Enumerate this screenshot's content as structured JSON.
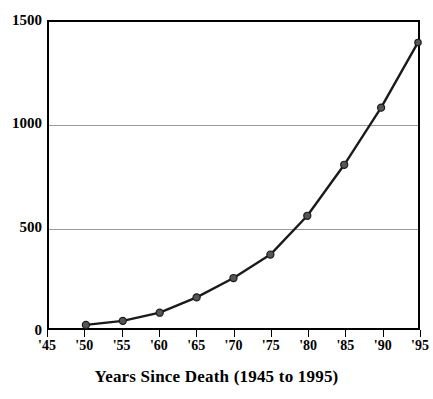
{
  "chart_data": {
    "type": "line",
    "title": "",
    "xlabel": "Years Since Death (1945 to 1995)",
    "ylabel": "",
    "xlim": [
      1945,
      1995
    ],
    "ylim": [
      0,
      1500
    ],
    "grid": "horizontal-only",
    "legend": "none",
    "marker": "filled-circle",
    "line_color": "#1a1a1a",
    "marker_color": "#555555",
    "gridline_color": "#9a9a9a",
    "axis_color": "#000000",
    "background": "#ffffff",
    "x_tick_labels": [
      "'45",
      "'50",
      "'55",
      "'60",
      "'65",
      "'70",
      "'75",
      "'80",
      "'85",
      "'90",
      "'95"
    ],
    "x_tick_values": [
      1945,
      1950,
      1955,
      1960,
      1965,
      1970,
      1975,
      1980,
      1985,
      1990,
      1995
    ],
    "y_tick_labels": [
      "0",
      "500",
      "1000",
      "1500"
    ],
    "y_tick_values": [
      0,
      500,
      1000,
      1500
    ],
    "gridline_values": [
      500,
      1000
    ],
    "x": [
      1950,
      1955,
      1960,
      1965,
      1970,
      1975,
      1980,
      1985,
      1990,
      1995
    ],
    "values": [
      15,
      35,
      75,
      150,
      245,
      360,
      550,
      800,
      1080,
      1400
    ],
    "points": [
      {
        "x": 1950,
        "label": "'50",
        "y": 15
      },
      {
        "x": 1955,
        "label": "'55",
        "y": 35
      },
      {
        "x": 1960,
        "label": "'60",
        "y": 75
      },
      {
        "x": 1965,
        "label": "'65",
        "y": 150
      },
      {
        "x": 1970,
        "label": "'70",
        "y": 245
      },
      {
        "x": 1975,
        "label": "'75",
        "y": 360
      },
      {
        "x": 1980,
        "label": "'80",
        "y": 550
      },
      {
        "x": 1985,
        "label": "'85",
        "y": 800
      },
      {
        "x": 1990,
        "label": "'90",
        "y": 1080
      },
      {
        "x": 1995,
        "label": "'95",
        "y": 1400
      }
    ]
  },
  "axis_title": {
    "text": "Years Since Death (1945 to 1995)"
  }
}
